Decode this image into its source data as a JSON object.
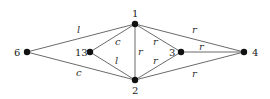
{
  "diagram": {
    "type": "labeled-graph",
    "nodes": [
      {
        "id": "6",
        "label": "6",
        "x": 27,
        "y": 52,
        "label_dx": -13,
        "label_dy": 4
      },
      {
        "id": "13",
        "label": "13",
        "x": 90,
        "y": 52,
        "label_dx": -15,
        "label_dy": 4
      },
      {
        "id": "1",
        "label": "1",
        "x": 135,
        "y": 24,
        "label_dx": -3,
        "label_dy": -7
      },
      {
        "id": "2",
        "label": "2",
        "x": 135,
        "y": 80,
        "label_dx": -3,
        "label_dy": 14
      },
      {
        "id": "3",
        "label": "3",
        "x": 181,
        "y": 52,
        "label_dx": -12,
        "label_dy": 4
      },
      {
        "id": "4",
        "label": "4",
        "x": 244,
        "y": 52,
        "label_dx": 8,
        "label_dy": 4
      }
    ],
    "edges": [
      {
        "from": "6",
        "to": "1",
        "label": "l",
        "lx": 77,
        "ly": 33
      },
      {
        "from": "6",
        "to": "2",
        "label": "c",
        "lx": 76,
        "ly": 76
      },
      {
        "from": "13",
        "to": "1",
        "label": "c",
        "lx": 115,
        "ly": 45
      },
      {
        "from": "13",
        "to": "2",
        "label": "l",
        "lx": 115,
        "ly": 64
      },
      {
        "from": "1",
        "to": "2",
        "label": "r",
        "lx": 138,
        "ly": 55
      },
      {
        "from": "1",
        "to": "3",
        "label": "r",
        "lx": 153,
        "ly": 45
      },
      {
        "from": "2",
        "to": "3",
        "label": "r",
        "lx": 153,
        "ly": 64
      },
      {
        "from": "1",
        "to": "4",
        "label": "r",
        "lx": 192,
        "ly": 33
      },
      {
        "from": "3",
        "to": "4",
        "label": "r",
        "lx": 199,
        "ly": 50
      },
      {
        "from": "2",
        "to": "4",
        "label": "r",
        "lx": 192,
        "ly": 77
      }
    ]
  }
}
